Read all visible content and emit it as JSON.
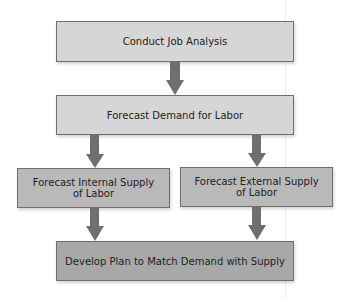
{
  "diagram": {
    "type": "flowchart",
    "nodes": [
      {
        "id": "job_analysis",
        "label": "Conduct Job Analysis"
      },
      {
        "id": "demand",
        "label": "Forecast Demand for Labor"
      },
      {
        "id": "internal_supply",
        "label_line1": "Forecast Internal Supply",
        "label_line2": "of Labor"
      },
      {
        "id": "external_supply",
        "label_line1": "Forecast External Supply",
        "label_line2": "of Labor"
      },
      {
        "id": "plan",
        "label": "Develop Plan to Match Demand with Supply"
      }
    ],
    "edges": [
      {
        "from": "job_analysis",
        "to": "demand"
      },
      {
        "from": "demand",
        "to": "internal_supply"
      },
      {
        "from": "demand",
        "to": "external_supply"
      },
      {
        "from": "internal_supply",
        "to": "plan"
      },
      {
        "from": "external_supply",
        "to": "plan"
      }
    ],
    "colors": {
      "box_light": "#d6d6d6",
      "box_mid": "#b9b9b9",
      "box_dark": "#a8a8a8",
      "arrow": "#6f6f6f",
      "border": "#6e6e6e"
    }
  }
}
